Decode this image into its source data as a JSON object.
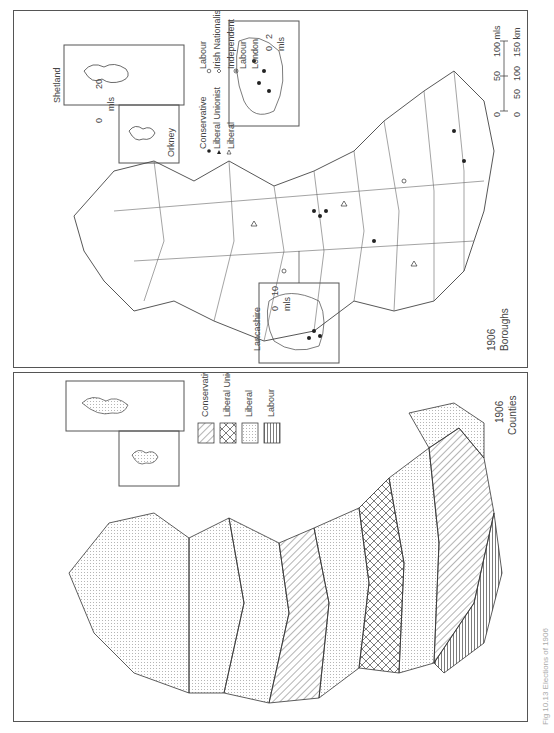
{
  "figure": {
    "caption": "Fig 10.13 Elections of 1906"
  },
  "boroughs_map": {
    "year": "1906",
    "subtitle": "Boroughs",
    "legend": [
      {
        "symbol": "filled-circle",
        "label": "Conservative"
      },
      {
        "symbol": "filled-triangle",
        "label": "Liberal Unionist"
      },
      {
        "symbol": "open-triangle",
        "label": "Liberal"
      },
      {
        "symbol": "open-circle",
        "label": "Labour"
      },
      {
        "symbol": "open-diamond",
        "label": "Irish Nationalist"
      },
      {
        "symbol": "open-square",
        "label": "Independent Labour"
      },
      {
        "symbol": "circled-dot",
        "label": "London"
      }
    ],
    "legend_col2": {
      "labour": "Labour",
      "irish": "Irish Nationalist",
      "independent": "Independent",
      "labour2": "Labour",
      "london": "London"
    },
    "legend_col1": {
      "conservative": "Conservative",
      "liberal_unionist": "Liberal Unionist",
      "liberal": "Liberal"
    },
    "insets": {
      "shetland": "Shetland",
      "orkney": "Orkney",
      "orkney_scale": {
        "min": "0",
        "max": "20",
        "unit": "mls"
      },
      "london_scale": {
        "min": "0",
        "max": "2",
        "unit": "mls"
      },
      "lancashire": "Lancashire",
      "lancashire_scale": {
        "min": "0",
        "max": "10",
        "unit": "mls"
      }
    },
    "scale_bar": {
      "miles": [
        "0",
        "50",
        "100 mls"
      ],
      "km": [
        "0",
        "50",
        "100",
        "150 km"
      ]
    }
  },
  "counties_map": {
    "year": "1906",
    "subtitle": "Counties",
    "legend": [
      {
        "pattern": "diagonal-hatch",
        "label": "Conservative"
      },
      {
        "pattern": "cross-hatch",
        "label": "Liberal Unionist"
      },
      {
        "pattern": "stipple",
        "label": "Liberal"
      },
      {
        "pattern": "vertical-lines",
        "label": "Labour"
      }
    ],
    "insets": {
      "shetland": "Shetland",
      "orkney": "Orkney"
    }
  }
}
